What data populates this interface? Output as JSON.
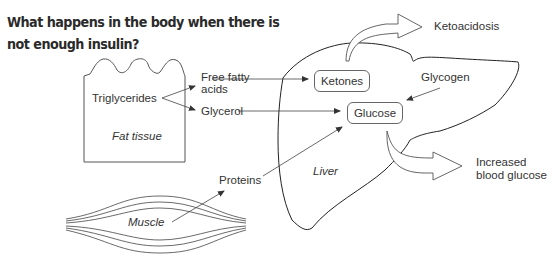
{
  "title": "What happens in the body when there is not enough insulin?",
  "fat_tissue": {
    "label": "Fat tissue",
    "content": "Triglycerides",
    "products": [
      "Free fatty acids",
      "Glycerol"
    ]
  },
  "muscle": {
    "label": "Muscle",
    "product": "Proteins"
  },
  "liver": {
    "label": "Liver",
    "nodes": {
      "ketones": "Ketones",
      "glucose": "Glucose",
      "glycogen": "Glycogen"
    }
  },
  "outcomes": {
    "ketoacidosis": "Ketoacidosis",
    "increased_blood_glucose_line1": "Increased",
    "increased_blood_glucose_line2": "blood glucose"
  },
  "labels": {
    "free_fatty_line1": "Free fatty",
    "free_fatty_line2": "acids",
    "glycerol": "Glycerol",
    "triglycerides": "Triglycerides",
    "proteins": "Proteins"
  }
}
